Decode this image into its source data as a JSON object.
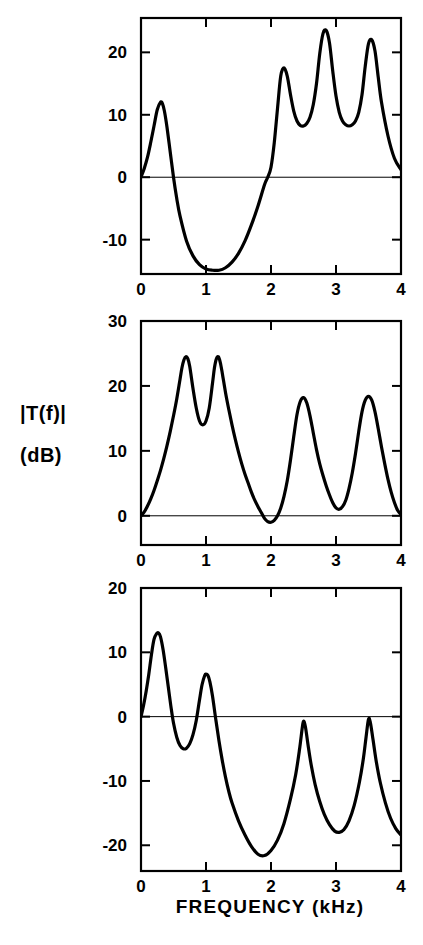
{
  "figure": {
    "background_color": "#ffffff",
    "line_color": "#000000",
    "y_axis_label_line1": "|T(f)|",
    "y_axis_label_line2": "(dB)",
    "x_axis_label": "FREQUENCY  (kHz)"
  },
  "chart_data": [
    {
      "type": "line",
      "panel": "top",
      "title": "",
      "xlabel": "",
      "ylabel": "|T(f)| (dB)",
      "xlim": [
        0,
        4
      ],
      "ylim": [
        -15.5,
        25.5
      ],
      "grid": false,
      "legend": null,
      "xticks": [
        0,
        1,
        2,
        3,
        4
      ],
      "xticklabels": [
        "0",
        "1",
        "2",
        "3",
        "4"
      ],
      "yticks": [
        20,
        10,
        0,
        -10
      ],
      "yticklabels": [
        "20",
        "10",
        "0",
        "-10"
      ],
      "zero_line": true,
      "x": [
        0.0,
        0.05,
        0.1,
        0.15,
        0.2,
        0.25,
        0.3,
        0.33,
        0.36,
        0.4,
        0.45,
        0.5,
        0.55,
        0.6,
        0.7,
        0.8,
        0.9,
        1.0,
        1.1,
        1.2,
        1.3,
        1.4,
        1.5,
        1.6,
        1.7,
        1.8,
        1.9,
        1.95,
        2.0,
        2.05,
        2.1,
        2.15,
        2.2,
        2.25,
        2.3,
        2.35,
        2.4,
        2.45,
        2.5,
        2.55,
        2.6,
        2.65,
        2.7,
        2.75,
        2.8,
        2.85,
        2.9,
        2.95,
        3.0,
        3.05,
        3.1,
        3.15,
        3.2,
        3.25,
        3.3,
        3.35,
        3.4,
        3.45,
        3.5,
        3.55,
        3.6,
        3.65,
        3.7,
        3.8,
        3.9,
        4.0
      ],
      "y": [
        0.0,
        1.4,
        3.2,
        5.6,
        8.2,
        10.8,
        12.0,
        11.8,
        10.6,
        8.0,
        4.0,
        0.0,
        -3.4,
        -6.2,
        -10.2,
        -12.6,
        -14.0,
        -14.7,
        -14.9,
        -14.9,
        -14.5,
        -13.6,
        -12.2,
        -10.2,
        -7.6,
        -4.6,
        -1.2,
        0.0,
        1.6,
        5.5,
        11.0,
        16.2,
        17.5,
        16.2,
        13.2,
        10.6,
        9.0,
        8.3,
        8.2,
        8.6,
        9.6,
        11.6,
        15.0,
        19.8,
        23.0,
        23.5,
        21.5,
        17.0,
        13.0,
        10.4,
        9.0,
        8.4,
        8.2,
        8.4,
        9.0,
        10.4,
        13.2,
        17.8,
        21.4,
        22.0,
        20.2,
        16.0,
        12.0,
        6.6,
        3.0,
        1.2
      ]
    },
    {
      "type": "line",
      "panel": "middle",
      "title": "",
      "xlabel": "",
      "ylabel": "|T(f)| (dB)",
      "xlim": [
        0,
        4
      ],
      "ylim": [
        -4.5,
        30
      ],
      "grid": false,
      "legend": null,
      "xticks": [
        0,
        1,
        2,
        3,
        4
      ],
      "xticklabels": [
        "0",
        "1",
        "2",
        "3",
        "4"
      ],
      "yticks": [
        30,
        20,
        10,
        0
      ],
      "yticklabels": [
        "30",
        "20",
        "10",
        "0"
      ],
      "zero_line": true,
      "x": [
        0.0,
        0.05,
        0.1,
        0.15,
        0.2,
        0.25,
        0.3,
        0.35,
        0.4,
        0.45,
        0.5,
        0.55,
        0.6,
        0.63,
        0.66,
        0.69,
        0.72,
        0.75,
        0.8,
        0.85,
        0.9,
        0.95,
        1.0,
        1.05,
        1.1,
        1.13,
        1.16,
        1.19,
        1.22,
        1.25,
        1.3,
        1.35,
        1.4,
        1.45,
        1.5,
        1.55,
        1.6,
        1.65,
        1.7,
        1.75,
        1.8,
        1.85,
        1.9,
        1.95,
        2.0,
        2.05,
        2.1,
        2.15,
        2.2,
        2.25,
        2.3,
        2.35,
        2.4,
        2.45,
        2.5,
        2.55,
        2.6,
        2.65,
        2.7,
        2.75,
        2.8,
        2.85,
        2.9,
        2.95,
        3.0,
        3.05,
        3.1,
        3.15,
        3.2,
        3.25,
        3.3,
        3.35,
        3.4,
        3.45,
        3.5,
        3.55,
        3.6,
        3.65,
        3.7,
        3.75,
        3.8,
        3.85,
        3.9,
        3.95,
        4.0
      ],
      "y": [
        0.0,
        0.6,
        1.5,
        2.6,
        3.9,
        5.4,
        7.0,
        8.8,
        10.8,
        13.0,
        15.4,
        18.0,
        21.0,
        22.8,
        24.0,
        24.5,
        24.2,
        23.0,
        19.6,
        16.6,
        14.6,
        14.0,
        14.6,
        16.6,
        20.4,
        22.8,
        24.2,
        24.5,
        23.6,
        22.0,
        19.0,
        16.4,
        14.0,
        11.8,
        9.8,
        8.0,
        6.4,
        5.0,
        3.6,
        2.4,
        1.4,
        0.5,
        -0.4,
        -0.9,
        -1.0,
        -0.7,
        0.0,
        1.2,
        3.0,
        5.4,
        8.6,
        12.2,
        15.6,
        17.6,
        18.2,
        17.4,
        15.4,
        12.8,
        10.2,
        8.0,
        6.2,
        4.6,
        3.2,
        2.0,
        1.2,
        1.0,
        1.4,
        2.4,
        4.2,
        6.6,
        9.6,
        13.0,
        16.0,
        17.8,
        18.4,
        17.8,
        16.0,
        13.4,
        10.6,
        8.0,
        5.6,
        3.6,
        2.0,
        0.8,
        0.2
      ]
    },
    {
      "type": "line",
      "panel": "bottom",
      "title": "",
      "xlabel": "FREQUENCY  (kHz)",
      "ylabel": "|T(f)| (dB)",
      "xlim": [
        0,
        4
      ],
      "ylim": [
        -24,
        20
      ],
      "grid": false,
      "legend": null,
      "xticks": [
        0,
        1,
        2,
        3,
        4
      ],
      "xticklabels": [
        "0",
        "1",
        "2",
        "3",
        "4"
      ],
      "yticks": [
        20,
        10,
        0,
        -10,
        -20
      ],
      "yticklabels": [
        "20",
        "10",
        "0",
        "-10",
        "-20"
      ],
      "zero_line": true,
      "x": [
        0.0,
        0.04,
        0.08,
        0.12,
        0.16,
        0.2,
        0.24,
        0.27,
        0.3,
        0.34,
        0.38,
        0.42,
        0.46,
        0.5,
        0.55,
        0.6,
        0.65,
        0.7,
        0.75,
        0.8,
        0.85,
        0.9,
        0.94,
        0.98,
        1.0,
        1.03,
        1.06,
        1.1,
        1.15,
        1.2,
        1.25,
        1.3,
        1.35,
        1.4,
        1.5,
        1.6,
        1.7,
        1.8,
        1.9,
        2.0,
        2.1,
        2.2,
        2.3,
        2.38,
        2.44,
        2.48,
        2.5,
        2.53,
        2.57,
        2.62,
        2.68,
        2.75,
        2.82,
        2.9,
        2.98,
        3.05,
        3.12,
        3.2,
        3.28,
        3.36,
        3.42,
        3.46,
        3.5,
        3.53,
        3.57,
        3.62,
        3.68,
        3.76,
        3.84,
        3.92,
        4.0
      ],
      "y": [
        0.0,
        1.8,
        4.0,
        6.6,
        9.6,
        12.0,
        12.9,
        13.0,
        12.4,
        10.4,
        7.6,
        4.6,
        1.6,
        -1.0,
        -3.2,
        -4.5,
        -5.0,
        -4.9,
        -4.2,
        -2.8,
        -0.6,
        2.6,
        5.0,
        6.4,
        6.6,
        6.4,
        5.4,
        3.2,
        -0.4,
        -3.8,
        -6.8,
        -9.4,
        -11.6,
        -13.4,
        -16.2,
        -18.4,
        -20.2,
        -21.4,
        -21.6,
        -20.8,
        -19.2,
        -16.6,
        -12.8,
        -9.0,
        -5.0,
        -1.8,
        -0.7,
        -1.6,
        -4.4,
        -7.6,
        -10.6,
        -13.2,
        -15.2,
        -16.8,
        -17.8,
        -18.0,
        -17.6,
        -16.2,
        -13.8,
        -10.2,
        -6.6,
        -3.4,
        -0.4,
        -1.0,
        -3.6,
        -7.0,
        -10.2,
        -13.4,
        -15.8,
        -17.4,
        -18.4
      ]
    }
  ]
}
